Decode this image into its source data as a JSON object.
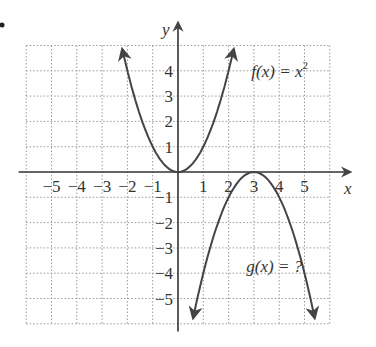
{
  "chart_data": {
    "type": "line",
    "title": "",
    "xlabel": "x",
    "ylabel": "y",
    "xlim": [
      -6,
      6
    ],
    "ylim": [
      -6,
      5
    ],
    "grid": true,
    "x_tick_labels": [
      "-5",
      "-4",
      "-3",
      "-2",
      "-1",
      "1",
      "2",
      "3",
      "4",
      "5"
    ],
    "y_tick_labels": [
      "4",
      "3",
      "2",
      "1",
      "-1",
      "-2",
      "-3",
      "-4",
      "-5"
    ],
    "series": [
      {
        "name": "f(x) = x^2",
        "equation": "f(x) = x^2",
        "x": [
          -2.2,
          -2,
          -1.5,
          -1,
          -0.5,
          0,
          0.5,
          1,
          1.5,
          2,
          2.2
        ],
        "y": [
          4.84,
          4,
          2.25,
          1,
          0.25,
          0,
          0.25,
          1,
          2.25,
          4,
          4.84
        ]
      },
      {
        "name": "g(x) = ?",
        "equation": "g(x) = -(x-3)^2",
        "x": [
          0.6,
          1,
          1.5,
          2,
          2.5,
          3,
          3.5,
          4,
          4.5,
          5,
          5.4
        ],
        "y": [
          -5.76,
          -4,
          -2.25,
          -1,
          -0.25,
          0,
          -0.25,
          -1,
          -2.25,
          -4,
          -5.76
        ]
      }
    ],
    "annotations": [
      "f(x) = x²",
      "g(x) = ?"
    ]
  },
  "labels": {
    "x_axis": "x",
    "y_axis": "y",
    "f_label_main": "f(x) = x",
    "f_label_exp": "2",
    "g_label": "g(x) = ?",
    "bullet": "•",
    "xticks": [
      {
        "v": -5,
        "t": "−5"
      },
      {
        "v": -4,
        "t": "−4"
      },
      {
        "v": -3,
        "t": "−3"
      },
      {
        "v": -2,
        "t": "−2"
      },
      {
        "v": -1,
        "t": "−1"
      },
      {
        "v": 1,
        "t": "1"
      },
      {
        "v": 2,
        "t": "2"
      },
      {
        "v": 3,
        "t": "3"
      },
      {
        "v": 4,
        "t": "4"
      },
      {
        "v": 5,
        "t": "5"
      }
    ],
    "yticks": [
      {
        "v": 4,
        "t": "4"
      },
      {
        "v": 3,
        "t": "3"
      },
      {
        "v": 2,
        "t": "2"
      },
      {
        "v": 1,
        "t": "1"
      },
      {
        "v": -1,
        "t": "−1"
      },
      {
        "v": -2,
        "t": "−2"
      },
      {
        "v": -3,
        "t": "−3"
      },
      {
        "v": -4,
        "t": "−4"
      },
      {
        "v": -5,
        "t": "−5"
      }
    ]
  },
  "colors": {
    "curve": "#444444",
    "axis": "#333333",
    "grid": "#9a9a9a"
  }
}
